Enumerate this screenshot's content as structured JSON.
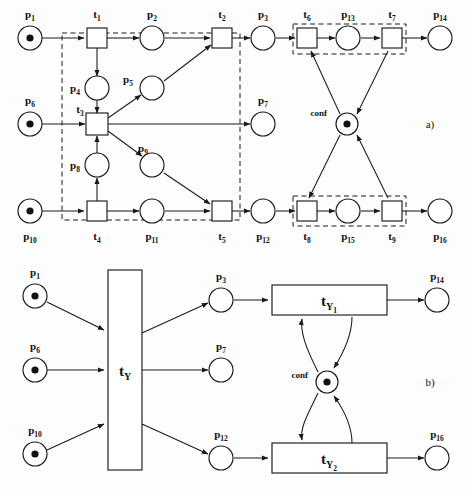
{
  "figure": {
    "panels": [
      {
        "id": "a",
        "label": "a)"
      },
      {
        "id": "b",
        "label": "b)"
      }
    ],
    "colors": {
      "stroke": "#1a1a1a",
      "fill": "#ffffff",
      "token": "#111111",
      "background": "#fdfdfd"
    }
  },
  "panel_a": {
    "label": "a)",
    "places": [
      {
        "name": "p1",
        "label": "p",
        "sub": "1",
        "tokens": 1,
        "cx": 30,
        "cy": 38
      },
      {
        "name": "p2",
        "label": "p",
        "sub": "2",
        "tokens": 0,
        "cx": 152,
        "cy": 38
      },
      {
        "name": "p3",
        "label": "p",
        "sub": "3",
        "tokens": 0,
        "cx": 263,
        "cy": 38
      },
      {
        "name": "p13",
        "label": "p",
        "sub": "13",
        "tokens": 0,
        "cx": 348,
        "cy": 38
      },
      {
        "name": "p14",
        "label": "p",
        "sub": "14",
        "tokens": 0,
        "cx": 440,
        "cy": 38
      },
      {
        "name": "p4",
        "label": "p",
        "sub": "4",
        "tokens": 0,
        "cx": 97,
        "cy": 88
      },
      {
        "name": "p5",
        "label": "p",
        "sub": "5",
        "tokens": 0,
        "cx": 152,
        "cy": 88
      },
      {
        "name": "p6",
        "label": "p",
        "sub": "6",
        "tokens": 1,
        "cx": 30,
        "cy": 124
      },
      {
        "name": "p7",
        "label": "p",
        "sub": "7",
        "tokens": 0,
        "cx": 263,
        "cy": 124
      },
      {
        "name": "conf",
        "label": "conf",
        "sub": "",
        "tokens": 1,
        "cx": 347,
        "cy": 124
      },
      {
        "name": "p8",
        "label": "p",
        "sub": "8",
        "tokens": 0,
        "cx": 97,
        "cy": 165
      },
      {
        "name": "p9",
        "label": "p",
        "sub": "9",
        "tokens": 0,
        "cx": 152,
        "cy": 165
      },
      {
        "name": "p10",
        "label": "p",
        "sub": "10",
        "tokens": 1,
        "cx": 30,
        "cy": 211
      },
      {
        "name": "p11",
        "label": "p",
        "sub": "11",
        "tokens": 0,
        "cx": 152,
        "cy": 211
      },
      {
        "name": "p12",
        "label": "p",
        "sub": "12",
        "tokens": 0,
        "cx": 263,
        "cy": 211
      },
      {
        "name": "p15",
        "label": "p",
        "sub": "15",
        "tokens": 0,
        "cx": 348,
        "cy": 211
      },
      {
        "name": "p16",
        "label": "p",
        "sub": "16",
        "tokens": 0,
        "cx": 440,
        "cy": 211
      }
    ],
    "transitions": [
      {
        "name": "t1",
        "label": "t",
        "sub": "1",
        "cx": 97,
        "cy": 38
      },
      {
        "name": "t2",
        "label": "t",
        "sub": "2",
        "cx": 222,
        "cy": 38
      },
      {
        "name": "t6",
        "label": "t",
        "sub": "6",
        "cx": 307,
        "cy": 38
      },
      {
        "name": "t7",
        "label": "t",
        "sub": "7",
        "cx": 392,
        "cy": 38
      },
      {
        "name": "t3",
        "label": "t",
        "sub": "3",
        "cx": 97,
        "cy": 124
      },
      {
        "name": "t4",
        "label": "t",
        "sub": "4",
        "cx": 97,
        "cy": 211
      },
      {
        "name": "t5",
        "label": "t",
        "sub": "5",
        "cx": 222,
        "cy": 211
      },
      {
        "name": "t8",
        "label": "t",
        "sub": "8",
        "cx": 307,
        "cy": 211
      },
      {
        "name": "t9",
        "label": "t",
        "sub": "9",
        "cx": 392,
        "cy": 211
      }
    ],
    "conf_label": "conf",
    "dashed_boxes": [
      {
        "name": "macro-transition-tY-box",
        "x": 62,
        "y": 33,
        "w": 178,
        "h": 187
      },
      {
        "name": "macro-transition-tY1-box",
        "x": 293,
        "y": 24,
        "w": 113,
        "h": 30
      },
      {
        "name": "macro-transition-tY2-box",
        "x": 293,
        "y": 196,
        "w": 113,
        "h": 30
      }
    ]
  },
  "panel_b": {
    "label": "b)",
    "places": [
      {
        "name": "p1",
        "label": "p",
        "sub": "1",
        "tokens": 1,
        "cx": 35,
        "cy": 296
      },
      {
        "name": "p3",
        "label": "p",
        "sub": "3",
        "tokens": 0,
        "cx": 221,
        "cy": 300
      },
      {
        "name": "p14",
        "label": "p",
        "sub": "14",
        "tokens": 0,
        "cx": 437,
        "cy": 300
      },
      {
        "name": "p6",
        "label": "p",
        "sub": "6",
        "tokens": 1,
        "cx": 35,
        "cy": 370
      },
      {
        "name": "p7",
        "label": "p",
        "sub": "7",
        "tokens": 0,
        "cx": 221,
        "cy": 370
      },
      {
        "name": "conf",
        "label": "conf",
        "sub": "",
        "tokens": 1,
        "cx": 327,
        "cy": 382
      },
      {
        "name": "p10",
        "label": "p",
        "sub": "10",
        "tokens": 1,
        "cx": 35,
        "cy": 454
      },
      {
        "name": "p12",
        "label": "p",
        "sub": "12",
        "tokens": 0,
        "cx": 221,
        "cy": 458
      },
      {
        "name": "p16",
        "label": "p",
        "sub": "16",
        "tokens": 0,
        "cx": 437,
        "cy": 458
      }
    ],
    "transitions": [
      {
        "name": "tY",
        "label": "t",
        "sub": "Y",
        "sub2": "",
        "x": 108,
        "y": 270,
        "w": 34,
        "h": 200
      },
      {
        "name": "tY1",
        "label": "t",
        "sub": "Y",
        "sub2": "1",
        "x": 272,
        "y": 285,
        "w": 115,
        "h": 30
      },
      {
        "name": "tY2",
        "label": "t",
        "sub": "Y",
        "sub2": "2",
        "x": 272,
        "y": 443,
        "w": 115,
        "h": 30
      }
    ],
    "conf_label": "conf"
  }
}
